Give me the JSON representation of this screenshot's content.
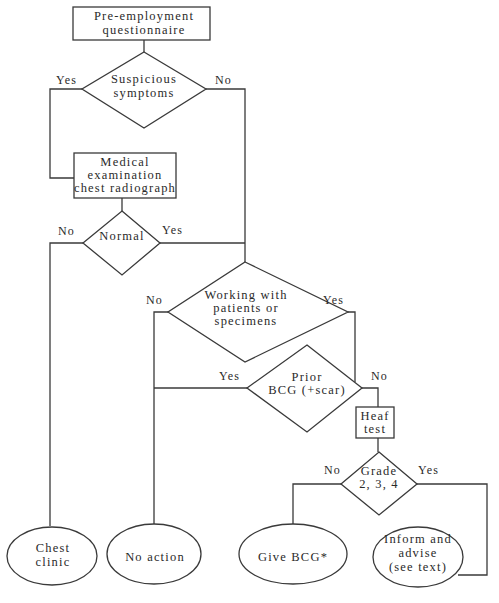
{
  "diagram": {
    "type": "flowchart",
    "nodes": {
      "start": {
        "lines": [
          "Pre-employment",
          "questionnaire"
        ],
        "shape": "rectangle"
      },
      "suspicious": {
        "lines": [
          "Suspicious",
          "symptoms"
        ],
        "shape": "diamond"
      },
      "medical": {
        "lines": [
          "Medical",
          "examination",
          "chest radiograph"
        ],
        "shape": "rectangle"
      },
      "normal": {
        "lines": [
          "Normal"
        ],
        "shape": "diamond"
      },
      "working": {
        "lines": [
          "Working with",
          "patients or",
          "specimens"
        ],
        "shape": "diamond"
      },
      "prior_bcg": {
        "lines": [
          "Prior",
          "BCG (+scar)"
        ],
        "shape": "diamond"
      },
      "heaf": {
        "lines": [
          "Heaf",
          "test"
        ],
        "shape": "rectangle"
      },
      "grade": {
        "lines": [
          "Grade",
          "2, 3, 4"
        ],
        "shape": "diamond"
      },
      "chest_clinic": {
        "lines": [
          "Chest",
          "clinic"
        ],
        "shape": "ellipse"
      },
      "no_action": {
        "lines": [
          "No action"
        ],
        "shape": "ellipse"
      },
      "give_bcg": {
        "lines": [
          "Give BCG*"
        ],
        "shape": "ellipse"
      },
      "inform": {
        "lines": [
          "Inform and",
          "advise",
          "(see text)"
        ],
        "shape": "ellipse"
      }
    },
    "edge_labels": {
      "suspicious_yes": "Yes",
      "suspicious_no": "No",
      "normal_no": "No",
      "normal_yes": "Yes",
      "working_no": "No",
      "working_yes": "Yes",
      "prior_yes": "Yes",
      "prior_no": "No",
      "grade_no": "No",
      "grade_yes": "Yes"
    },
    "edges": [
      {
        "from": "start",
        "to": "suspicious"
      },
      {
        "from": "suspicious",
        "to": "medical",
        "label": "Yes"
      },
      {
        "from": "suspicious",
        "to": "working",
        "label": "No"
      },
      {
        "from": "medical",
        "to": "normal"
      },
      {
        "from": "normal",
        "to": "chest_clinic",
        "label": "No"
      },
      {
        "from": "normal",
        "to": "working",
        "label": "Yes"
      },
      {
        "from": "working",
        "to": "no_action",
        "label": "No"
      },
      {
        "from": "working",
        "to": "prior_bcg",
        "label": "Yes"
      },
      {
        "from": "prior_bcg",
        "to": "no_action",
        "label": "Yes"
      },
      {
        "from": "prior_bcg",
        "to": "heaf",
        "label": "No"
      },
      {
        "from": "heaf",
        "to": "grade"
      },
      {
        "from": "grade",
        "to": "give_bcg",
        "label": "No"
      },
      {
        "from": "grade",
        "to": "inform",
        "label": "Yes"
      }
    ]
  }
}
